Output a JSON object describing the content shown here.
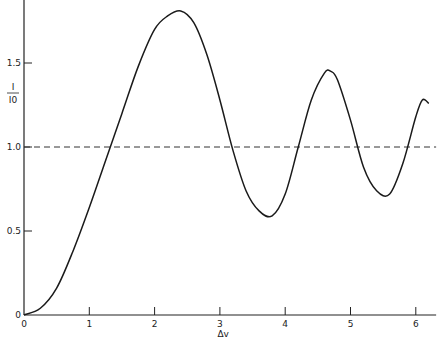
{
  "chart_data": {
    "type": "line",
    "title": "",
    "xlabel": "Δv",
    "ylabel": "I / I0",
    "ylabel_numerator": "I",
    "ylabel_denominator": "I0",
    "xlim": [
      0,
      6.25
    ],
    "ylim": [
      0,
      1.85
    ],
    "x_ticks": [
      0,
      1,
      2,
      3,
      4,
      5,
      6
    ],
    "x_tick_labels": [
      "0",
      "1",
      "2",
      "3",
      "4",
      "5",
      "6"
    ],
    "y_ticks": [
      0,
      0.5,
      1.0,
      1.5
    ],
    "y_tick_labels": [
      "0",
      "0.5",
      "1.0",
      "1.5"
    ],
    "grid": false,
    "legend": null,
    "reference_line": {
      "y": 1.0,
      "style": "dashed"
    },
    "series": [
      {
        "name": "I/I0",
        "style": "solid",
        "x": [
          0,
          0.25,
          0.5,
          0.75,
          1.0,
          1.25,
          1.5,
          1.75,
          2.0,
          2.2,
          2.4,
          2.6,
          2.8,
          3.0,
          3.2,
          3.4,
          3.6,
          3.8,
          4.0,
          4.2,
          4.4,
          4.6,
          4.7,
          4.8,
          5.0,
          5.2,
          5.4,
          5.6,
          5.8,
          6.0,
          6.1,
          6.2
        ],
        "y": [
          0,
          0.04,
          0.16,
          0.38,
          0.64,
          0.92,
          1.2,
          1.48,
          1.7,
          1.78,
          1.81,
          1.74,
          1.55,
          1.28,
          0.98,
          0.74,
          0.62,
          0.59,
          0.72,
          1.0,
          1.28,
          1.44,
          1.45,
          1.4,
          1.16,
          0.88,
          0.74,
          0.72,
          0.9,
          1.18,
          1.28,
          1.26
        ]
      }
    ]
  }
}
